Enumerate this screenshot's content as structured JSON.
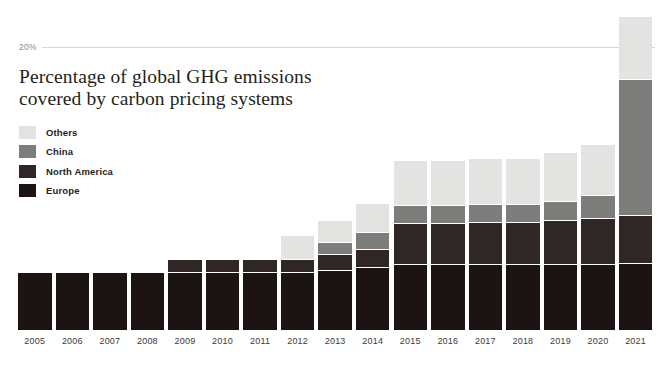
{
  "chart_data": {
    "type": "bar",
    "subtype": "stacked-bar",
    "title": "Percentage of global GHG emissions covered by carbon pricing systems",
    "title_lines": [
      "Percentage of global GHG emissions",
      "covered by carbon pricing systems"
    ],
    "xlabel": "",
    "ylabel": "",
    "ylim": [
      0,
      23.5
    ],
    "yticks": [
      20
    ],
    "ytick_labels": [
      "20%"
    ],
    "grid": true,
    "grid_axis": "y",
    "legend_position": "upper-left-inside",
    "stack_order_bottom_to_top": [
      "Europe",
      "North America",
      "China",
      "Others"
    ],
    "categories": [
      "2005",
      "2006",
      "2007",
      "2008",
      "2009",
      "2010",
      "2011",
      "2012",
      "2013",
      "2014",
      "2015",
      "2016",
      "2017",
      "2018",
      "2019",
      "2020",
      "2021"
    ],
    "series": [
      {
        "name": "Europe",
        "color": "#1c1413",
        "values": [
          4.0,
          4.0,
          4.0,
          4.0,
          4.0,
          4.0,
          4.0,
          4.0,
          4.2,
          4.4,
          4.6,
          4.6,
          4.6,
          4.6,
          4.6,
          4.6,
          4.7
        ]
      },
      {
        "name": "North America",
        "color": "#2e2725",
        "values": [
          0,
          0,
          0,
          0,
          0.9,
          0.9,
          0.9,
          0.9,
          1.0,
          1.2,
          2.8,
          2.8,
          2.9,
          2.9,
          3.0,
          3.2,
          3.3
        ]
      },
      {
        "name": "China",
        "color": "#7d7d7b",
        "values": [
          0,
          0,
          0,
          0,
          0,
          0,
          0,
          0,
          0.8,
          1.1,
          1.2,
          1.2,
          1.2,
          1.2,
          1.3,
          1.5,
          9.5
        ]
      },
      {
        "name": "Others",
        "color": "#e3e3e1",
        "values": [
          0,
          0,
          0,
          0,
          0,
          0,
          0,
          1.6,
          1.5,
          2.0,
          3.1,
          3.1,
          3.2,
          3.2,
          3.4,
          3.6,
          4.4
        ]
      }
    ],
    "totals": [
      4.0,
      4.0,
      4.0,
      4.0,
      4.9,
      4.9,
      4.9,
      6.5,
      7.0,
      8.7,
      11.7,
      11.7,
      11.9,
      11.9,
      12.3,
      12.9,
      21.9
    ]
  },
  "legend": {
    "items": [
      {
        "label": "Others",
        "color": "#e3e3e1"
      },
      {
        "label": "China",
        "color": "#7d7d7b"
      },
      {
        "label": "North America",
        "color": "#2e2725"
      },
      {
        "label": "Europe",
        "color": "#1c1413"
      }
    ]
  },
  "axis": {
    "y_tick_label": "20%",
    "gridline_color": "#d8d8d6"
  },
  "colors": {
    "background": "#ffffff",
    "text": "#231f20",
    "axis_text": "#3d3a38",
    "tick_text": "#8a8a88"
  }
}
